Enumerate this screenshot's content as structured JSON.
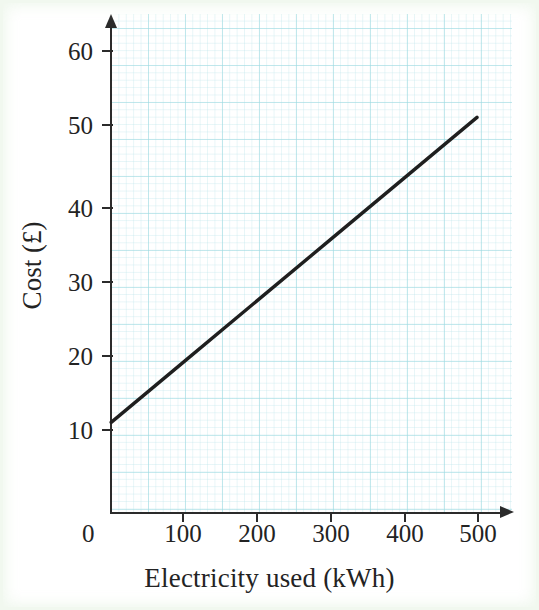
{
  "chart_data": {
    "type": "line",
    "title": "",
    "subtitle": "",
    "xlabel": "Electricity used (kWh)",
    "ylabel": "Cost (£)",
    "xlim": [
      0,
      540
    ],
    "ylim": [
      0,
      65
    ],
    "x_ticks": [
      0,
      100,
      200,
      300,
      400,
      500
    ],
    "x_tick_labels": [
      "0",
      "100",
      "200",
      "300",
      "400",
      "500"
    ],
    "y_ticks": [
      0,
      10,
      20,
      30,
      40,
      50,
      60
    ],
    "y_tick_labels": [
      "",
      "10",
      "20",
      "30",
      "40",
      "50",
      "60"
    ],
    "origin_label": "0",
    "grid": true,
    "grid_style": "graph-paper",
    "grid_color": "#8fd3dd",
    "legend": false,
    "legend_position": "none",
    "series": [
      {
        "name": "Cost of electricity",
        "color": "#1f1f1f",
        "line_width": 3,
        "x": [
          0,
          100,
          200,
          300,
          400,
          500
        ],
        "values": [
          11,
          19,
          27,
          35,
          43,
          51
        ]
      }
    ],
    "annotations": [],
    "intercept": 11,
    "slope_per_kwh": 0.08
  },
  "axis": {
    "y_title": "Cost (£)",
    "x_title": "Electricity used (kWh)",
    "origin": "0"
  },
  "ticks": {
    "y": [
      {
        "label": "60",
        "value": 60
      },
      {
        "label": "50",
        "value": 50
      },
      {
        "label": "40",
        "value": 40
      },
      {
        "label": "30",
        "value": 30
      },
      {
        "label": "20",
        "value": 20
      },
      {
        "label": "10",
        "value": 10
      }
    ],
    "x": [
      {
        "label": "100",
        "value": 100
      },
      {
        "label": "200",
        "value": 200
      },
      {
        "label": "300",
        "value": 300
      },
      {
        "label": "400",
        "value": 400
      },
      {
        "label": "500",
        "value": 500
      }
    ]
  },
  "colors": {
    "line": "#1f1f1f",
    "axis": "#2b2b2b",
    "grid": "#8fd3dd",
    "background": "#ffffff",
    "page_tint": "#f2f8f0"
  }
}
